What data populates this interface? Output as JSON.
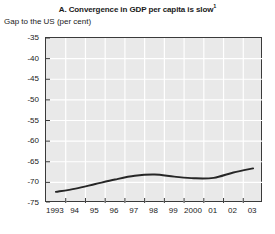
{
  "chart_data": {
    "type": "line",
    "title": "A. Convergence in GDP per capita is slow",
    "title_footnote_marker": "1",
    "subtitle": "Gap to the US (per cent)",
    "xlabel": "",
    "ylabel": "Gap to the US (per cent)",
    "x": [
      1993,
      1994,
      1995,
      1996,
      1997,
      1998,
      1999,
      2000,
      2001,
      2002,
      2003
    ],
    "categories": [
      "1993",
      "94",
      "95",
      "96",
      "97",
      "98",
      "99",
      "2000",
      "01",
      "02",
      "03"
    ],
    "values": [
      -72.3,
      -71.5,
      -70.4,
      -69.3,
      -68.4,
      -68.1,
      -68.6,
      -69.0,
      -68.9,
      -67.6,
      -66.6
    ],
    "series": [
      {
        "name": "Gap to the US (per cent)",
        "values": [
          -72.3,
          -71.5,
          -70.4,
          -69.3,
          -68.4,
          -68.1,
          -68.6,
          -69.0,
          -68.9,
          -67.6,
          -66.6
        ]
      }
    ],
    "ylim": [
      -75,
      -35
    ],
    "yticks": [
      -35,
      -40,
      -45,
      -50,
      -55,
      -60,
      -65,
      -70,
      -75
    ],
    "ytick_labels": [
      "-35",
      "-40",
      "-45",
      "-50",
      "-55",
      "-60",
      "-65",
      "-70",
      "-75"
    ],
    "xtick_labels": [
      "1993",
      "94",
      "95",
      "96",
      "97",
      "98",
      "99",
      "2000",
      "01",
      "02",
      "03"
    ],
    "grid": true,
    "legend": "none",
    "plot_background_color": "#e9e9e9",
    "grid_color": "#ffffff",
    "line_color": "#262626",
    "axis_color": "#3a3a3a",
    "page_background_color": "#ffffff"
  }
}
